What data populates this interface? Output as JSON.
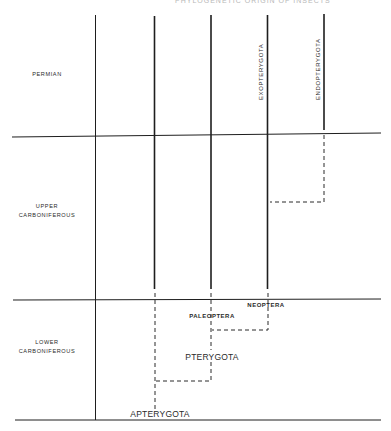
{
  "header": {
    "text": "PHYLOGENETIC ORIGIN OF INSECTS"
  },
  "periods": [
    {
      "label_lines": [
        "PERMIAN"
      ]
    },
    {
      "label_lines": [
        "UPPER",
        "CARBONIFEROUS"
      ]
    },
    {
      "label_lines": [
        "LOWER",
        "CARBONIFEROUS"
      ]
    }
  ],
  "taxa": {
    "exopterygota": "EXOPTERYGOTA",
    "endopterygota": "ENDOPTERYGOTA",
    "neoptera": "NEOPTERA",
    "paleoptera": "PALEOPTERA",
    "pterygota": "PTERYGOTA",
    "apterygota": "APTERYGOTA"
  },
  "colors": {
    "line": "#1e1e1e",
    "text": "#2a2a2a",
    "background": "#ffffff"
  }
}
